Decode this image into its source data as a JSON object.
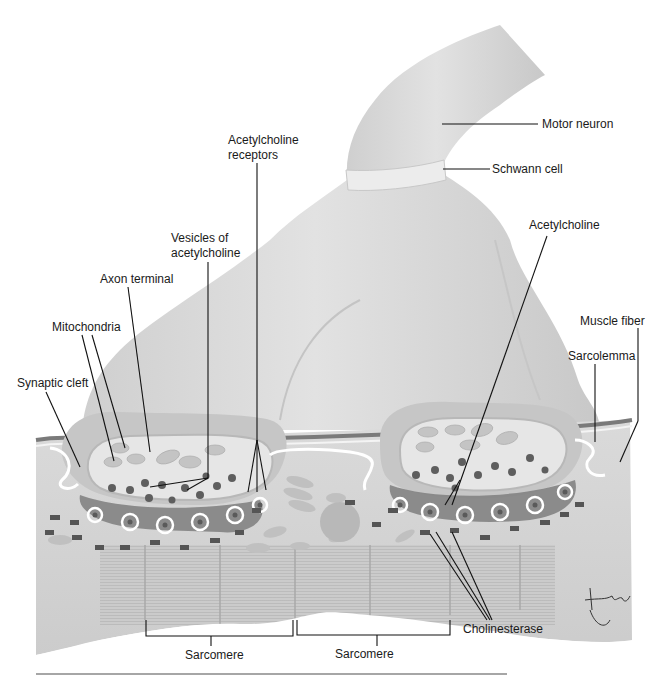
{
  "figure": {
    "signature": "tina",
    "colors": {
      "background": "#ffffff",
      "neuron": "#d2d2d2",
      "neuron_highlight": "#e4e4e4",
      "schwann": "#e6e6e6",
      "terminal_fill": "#e3e3e3",
      "cleft_dark": "#6e6e6e",
      "muscle": "#d4d4d4",
      "sarcomere": "#c4c4c4",
      "vesicle": "#5a5a5a",
      "leader_line": "#111111"
    }
  },
  "labels": {
    "motor_neuron": "Motor neuron",
    "schwann_cell": "Schwann cell",
    "ach_receptors_line1": "Acetylcholine",
    "ach_receptors_line2": "receptors",
    "vesicles_line1": "Vesicles of",
    "vesicles_line2": "acetylcholine",
    "axon_terminal": "Axon terminal",
    "mitochondria": "Mitochondria",
    "synaptic_cleft": "Synaptic cleft",
    "acetylcholine": "Acetylcholine",
    "muscle_fiber": "Muscle fiber",
    "sarcolemma": "Sarcolemma",
    "cholinesterase": "Cholinesterase",
    "sarcomere_left": "Sarcomere",
    "sarcomere_right": "Sarcomere"
  }
}
